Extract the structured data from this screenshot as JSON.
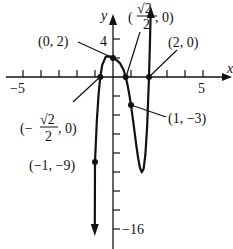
{
  "graph": {
    "function": "f(x) = (4x^4 - 1)(x - 2)",
    "x_axis_label": "x",
    "y_axis_label": "y",
    "x_tick_labels": {
      "left": "−5",
      "right": "5"
    },
    "y_tick_labels": {
      "top": "4",
      "bottom": "−16"
    },
    "points": [
      {
        "id": "p_y_intercept",
        "label": "(0, 2)",
        "x": 0,
        "y": 2
      },
      {
        "id": "p_zero_pos",
        "label_open": "(",
        "label_num": "√2",
        "label_den": "2",
        "label_close": ", 0)",
        "x": 0.7071,
        "y": 0
      },
      {
        "id": "p_zero_2",
        "label": "(2, 0)",
        "x": 2,
        "y": 0
      },
      {
        "id": "p_zero_neg",
        "label_open": "(−",
        "label_num": "√2",
        "label_den": "2",
        "label_close": ", 0)",
        "x": -0.7071,
        "y": 0
      },
      {
        "id": "p_one",
        "label": "(1, −3)",
        "x": 1,
        "y": -3
      },
      {
        "id": "p_neg_one",
        "label": "(−1, −9)",
        "x": -1,
        "y": -9
      }
    ],
    "x_range": [
      -5,
      5
    ],
    "y_range": [
      -16,
      4
    ],
    "x_tick_step": 1,
    "y_tick_step": 2,
    "line_color": "#111111",
    "background": "#ffffff"
  }
}
